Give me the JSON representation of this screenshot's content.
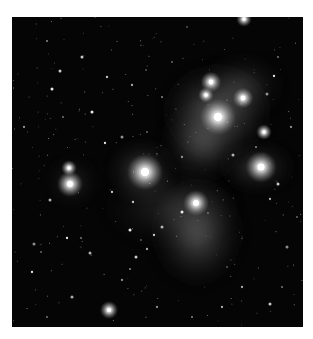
{
  "image": {
    "subject": "Pleiades star cluster with reflection nebulosity",
    "style": "grayscale astronomical photograph",
    "colors": {
      "background": "#ffffff",
      "sky": "#050505",
      "star": "#ffffff",
      "nebula": "#bfbfbf"
    }
  }
}
